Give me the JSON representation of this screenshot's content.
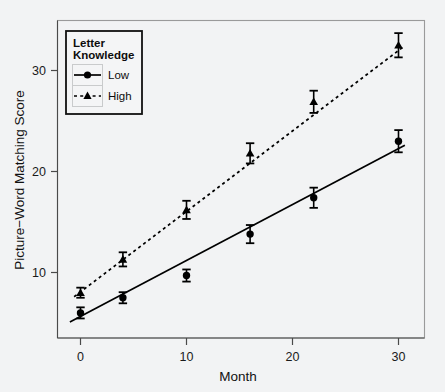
{
  "chart_data": {
    "type": "line",
    "title": "",
    "xlabel": "Month",
    "ylabel": "Picture−Word Matching Score",
    "xlim": [
      -2.2,
      32.5
    ],
    "ylim": [
      3.2,
      34.6
    ],
    "xticks": [
      0,
      10,
      20,
      30
    ],
    "xticklabels": [
      "0",
      "10",
      "20",
      "30"
    ],
    "yticks": [
      10,
      20,
      30
    ],
    "yticklabels": [
      "10",
      "20",
      "30"
    ],
    "grid": false,
    "legend_position": "top-left",
    "legend_title": "Letter Knowledge",
    "legend_title_lines": [
      "Letter",
      "Knowledge"
    ],
    "x": [
      0,
      4,
      10,
      16,
      22,
      30
    ],
    "series": [
      {
        "name": "Low",
        "marker": "circle",
        "linestyle": "solid",
        "color": "#000000",
        "values": [
          6.0,
          7.5,
          9.7,
          13.8,
          17.4,
          23.0
        ],
        "errors": [
          0.55,
          0.55,
          0.6,
          0.9,
          1.0,
          1.1
        ],
        "fit_endpoints": [
          {
            "x": -1.0,
            "y": 5.1
          },
          {
            "x": 30.6,
            "y": 22.6
          }
        ]
      },
      {
        "name": "High",
        "marker": "triangle",
        "linestyle": "dotted",
        "color": "#000000",
        "values": [
          8.0,
          11.3,
          16.2,
          21.8,
          26.9,
          32.5
        ],
        "errors": [
          0.5,
          0.7,
          0.9,
          1.0,
          1.1,
          1.2
        ],
        "fit_endpoints": [
          {
            "x": -0.6,
            "y": 7.6
          },
          {
            "x": 30.4,
            "y": 32.3
          }
        ]
      }
    ]
  },
  "axes": {
    "x_axis_title": "Month",
    "y_axis_title": "Picture−Word Matching Score"
  },
  "legend": {
    "title_line_1": "Letter",
    "title_line_2": "Knowledge",
    "entries": [
      {
        "label": "Low"
      },
      {
        "label": "High"
      }
    ]
  },
  "ticks": {
    "x": [
      "0",
      "10",
      "20",
      "30"
    ],
    "y": [
      "10",
      "20",
      "30"
    ]
  },
  "colors": {
    "background": "#f2f3f4",
    "ink": "#000000",
    "frame": "#9a9a9a",
    "axis": "#4a4a4a"
  }
}
